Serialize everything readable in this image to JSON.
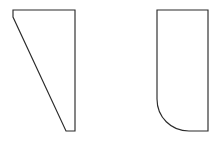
{
  "canvas": {
    "width": 223,
    "height": 143,
    "background_color": "#ffffff",
    "title": "Two Geometric Shapes"
  },
  "style": {
    "stroke_color": "#2b2b2b",
    "fill_color": "#ffffff",
    "stroke_width": 1.15
  },
  "shapes": [
    {
      "id": "left-shape",
      "name": "right-trapezoid",
      "description": "Quadrilateral with vertical right edge, horizontal top edge, short vertical stub at top-left, and a long diagonal edge running from upper-left down to lower-right.",
      "corner_style": "sharp",
      "vertices": [
        {
          "x": 13,
          "y": 10
        },
        {
          "x": 75,
          "y": 10
        },
        {
          "x": 75,
          "y": 131
        },
        {
          "x": 66,
          "y": 131
        },
        {
          "x": 13,
          "y": 17
        }
      ],
      "path": "M 13 10 L 75 10 L 75 131 L 66 131 L 13 17 Z",
      "bounds": {
        "x": 13,
        "y": 10,
        "width": 62,
        "height": 121
      }
    },
    {
      "id": "right-shape",
      "name": "rounded-corner-rectangle",
      "description": "Rectangle with three sharp corners and one large-radius rounded fillet at the bottom-left corner.",
      "corner_style": "one-rounded-corner",
      "corner_radius": 32,
      "rounded_corner": "bottom-left",
      "vertices": [
        {
          "x": 157,
          "y": 10
        },
        {
          "x": 208,
          "y": 10
        },
        {
          "x": 208,
          "y": 131
        },
        {
          "x": 189,
          "y": 131
        },
        {
          "x": 157,
          "y": 99
        }
      ],
      "path": "M 157 10 L 208 10 L 208 131 L 189 131 C 171 131 157 117 157 99 Z",
      "bounds": {
        "x": 157,
        "y": 10,
        "width": 51,
        "height": 121
      }
    }
  ]
}
